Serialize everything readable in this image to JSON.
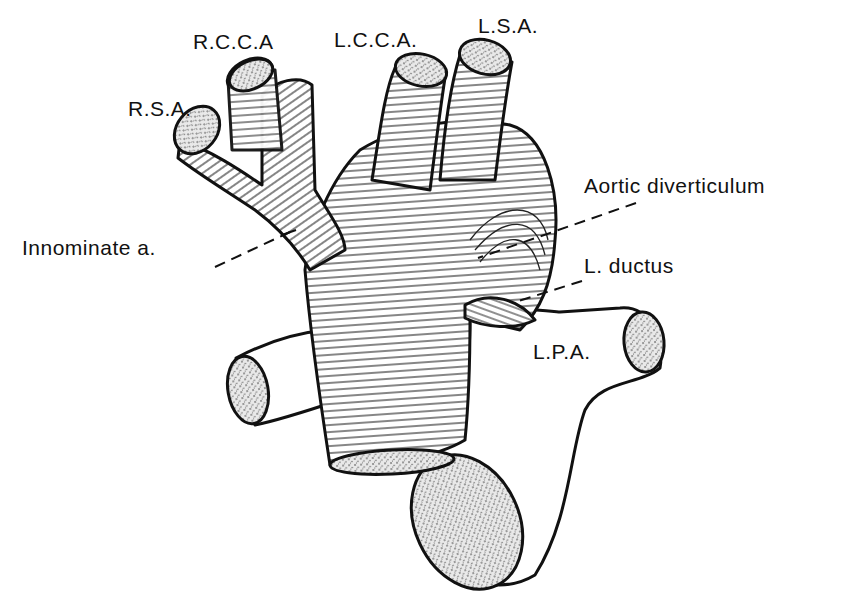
{
  "figure": {
    "type": "anatomical-illustration"
  },
  "labels": {
    "rsa": "R.S.A.",
    "rcca": "R.C.C.A",
    "lcca": "L.C.C.A.",
    "lsa": "L.S.A.",
    "innominate": "Innominate a.",
    "aortic_diverticulum": "Aortic diverticulum",
    "l_ductus": "L. ductus",
    "lpa": "L.P.A."
  },
  "colors": {
    "ink": "#111111",
    "paper": "#ffffff"
  }
}
